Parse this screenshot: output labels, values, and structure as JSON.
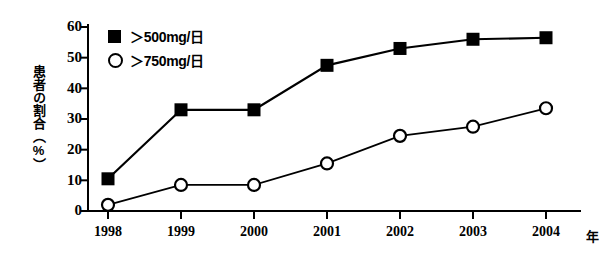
{
  "chart_data": {
    "type": "line",
    "title": "",
    "subtitle": "",
    "xlabel": "年",
    "ylabel": "患者の割合（%）",
    "categories": [
      "1998",
      "1999",
      "2000",
      "2001",
      "2002",
      "2003",
      "2004"
    ],
    "x": [
      1998,
      1999,
      2000,
      2001,
      2002,
      2003,
      2004
    ],
    "xlim": [
      1997.7,
      2004.5
    ],
    "ylim": [
      0,
      60
    ],
    "yticks": [
      0,
      10,
      20,
      30,
      40,
      50,
      60
    ],
    "ytick_labels": [
      "0",
      "10",
      "20",
      "30",
      "40",
      "50",
      "60"
    ],
    "xtick_labels": [
      "1998",
      "1999",
      "2000",
      "2001",
      "2002",
      "2003",
      "2004"
    ],
    "grid": false,
    "legend_position": "upper-left-inside",
    "series": [
      {
        "name": "＞500mg/日",
        "marker": "filled-square",
        "color": "#000000",
        "values": [
          10.5,
          33,
          33,
          47.5,
          53,
          56,
          56.5
        ]
      },
      {
        "name": "＞750mg/日",
        "marker": "open-circle",
        "color": "#000000",
        "values": [
          2,
          8.5,
          8.5,
          15.5,
          24.5,
          27.5,
          33.5
        ]
      }
    ],
    "annotations": []
  },
  "legend": {
    "items": [
      {
        "label": "＞500mg/日",
        "marker": "filled-square"
      },
      {
        "label": "＞750mg/日",
        "marker": "open-circle"
      }
    ]
  },
  "axes": {
    "y_title": "患者の割合（%）",
    "x_title": "年"
  }
}
